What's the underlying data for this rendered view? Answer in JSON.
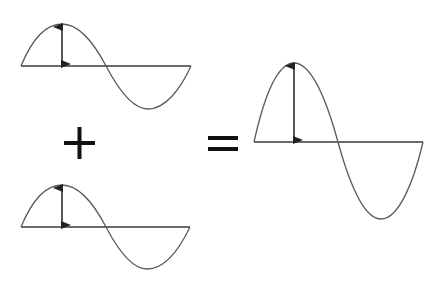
{
  "diagram": {
    "colors": {
      "background": "#ffffff",
      "wave": "#5a5a5a",
      "line": "#3a3a3a",
      "symbol": "#111111"
    },
    "nodes": [
      {
        "id": "wave-a",
        "type": "sine-wave",
        "amplitude_px": 42,
        "baseline_y": 66,
        "x_start": 21,
        "x_end": 191,
        "annotation": "amplitude-arrow"
      },
      {
        "id": "plus",
        "type": "operator",
        "symbol": "+"
      },
      {
        "id": "wave-b",
        "type": "sine-wave",
        "amplitude_px": 42,
        "baseline_y": 227,
        "x_start": 21,
        "x_end": 190,
        "annotation": "amplitude-arrow"
      },
      {
        "id": "equals",
        "type": "operator",
        "symbol": "="
      },
      {
        "id": "wave-sum",
        "type": "sine-wave",
        "amplitude_px": 79,
        "baseline_y": 142,
        "x_start": 254,
        "x_end": 423,
        "annotation": "amplitude-arrow"
      }
    ],
    "relation": "wave-a + wave-b = wave-sum"
  }
}
